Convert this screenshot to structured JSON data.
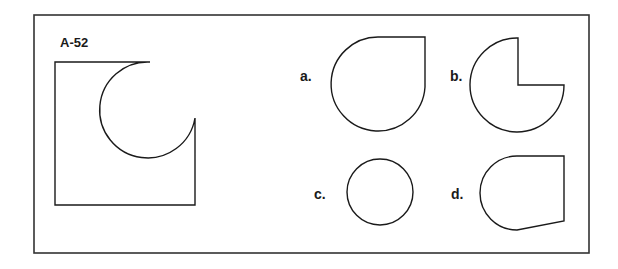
{
  "puzzle": {
    "id_label": "A-52",
    "main_figure": "square-with-circular-cutout-top-right",
    "options": [
      {
        "key": "a",
        "label": "a.",
        "shape": "teardrop-circle-with-square-top-right-corner"
      },
      {
        "key": "b",
        "label": "b.",
        "shape": "three-quarter-circle-missing-top-right-quadrant"
      },
      {
        "key": "c",
        "label": "c.",
        "shape": "circle"
      },
      {
        "key": "d",
        "label": "d.",
        "shape": "half-circle-left-with-trapezoid-right"
      }
    ]
  },
  "colors": {
    "stroke": "#1a1a1a",
    "frame": "#333333",
    "background": "#ffffff"
  }
}
